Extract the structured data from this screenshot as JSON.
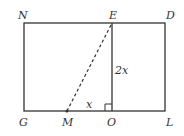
{
  "diagram": {
    "points": {
      "N": {
        "label": "N",
        "x": 24,
        "y": 23
      },
      "E": {
        "label": "E",
        "x": 112,
        "y": 23
      },
      "D": {
        "label": "D",
        "x": 165,
        "y": 23
      },
      "G": {
        "label": "G",
        "x": 24,
        "y": 111
      },
      "M": {
        "label": "M",
        "x": 67,
        "y": 111
      },
      "O": {
        "label": "O",
        "x": 112,
        "y": 111
      },
      "L": {
        "label": "L",
        "x": 165,
        "y": 111
      }
    },
    "segment_labels": {
      "EO": "2x",
      "MO": "x"
    },
    "colors": {
      "stroke": "#333333",
      "background": "#ffffff"
    }
  }
}
